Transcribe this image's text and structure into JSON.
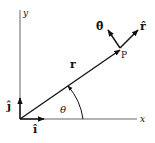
{
  "diagram": {
    "axes": {
      "x_label": "x",
      "y_label": "y"
    },
    "unit_vectors": {
      "i_hat": "î",
      "j_hat": "ĵ",
      "r_hat": "r̂",
      "theta_hat": "θ̂"
    },
    "position_vector_label": "r",
    "point_label": "P",
    "angle_label": "θ",
    "colors": {
      "stroke": "#111111",
      "axis": "#555555",
      "background": "#ffffff"
    }
  }
}
